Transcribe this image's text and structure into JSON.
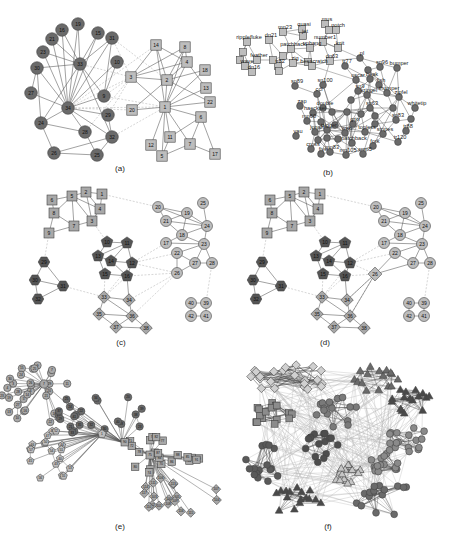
{
  "figure": {
    "colors": {
      "dark_node": "#6a6a6a",
      "darker_node": "#555555",
      "light_node": "#bdbdbd",
      "mid_node": "#a8a8a8",
      "edge": "#555555",
      "dashed_edge": "#bbbbbb",
      "node_stroke": "#444444"
    },
    "panels": [
      {
        "id": "a",
        "caption": "(a)"
      },
      {
        "id": "b",
        "caption": "(b)"
      },
      {
        "id": "c",
        "caption": "(c)"
      },
      {
        "id": "d",
        "caption": "(d)"
      },
      {
        "id": "e",
        "caption": "(e)"
      },
      {
        "id": "f",
        "caption": "(f)"
      }
    ]
  },
  "panel_a": {
    "caption": "(a)",
    "circles": [
      {
        "id": "19",
        "x": 78,
        "y": 24
      },
      {
        "id": "16",
        "x": 62,
        "y": 30
      },
      {
        "id": "15",
        "x": 98,
        "y": 33
      },
      {
        "id": "21",
        "x": 52,
        "y": 39
      },
      {
        "id": "31",
        "x": 112,
        "y": 38
      },
      {
        "id": "23",
        "x": 43,
        "y": 52
      },
      {
        "id": "33",
        "x": 80,
        "y": 64
      },
      {
        "id": "10",
        "x": 117,
        "y": 62
      },
      {
        "id": "30",
        "x": 37,
        "y": 68
      },
      {
        "id": "27",
        "x": 31,
        "y": 93
      },
      {
        "id": "9",
        "x": 104,
        "y": 96
      },
      {
        "id": "34",
        "x": 68,
        "y": 108
      },
      {
        "id": "29",
        "x": 108,
        "y": 115
      },
      {
        "id": "24",
        "x": 41,
        "y": 123
      },
      {
        "id": "28",
        "x": 85,
        "y": 132
      },
      {
        "id": "32",
        "x": 112,
        "y": 137
      },
      {
        "id": "26",
        "x": 54,
        "y": 153
      },
      {
        "id": "25",
        "x": 97,
        "y": 155
      }
    ],
    "squares": [
      {
        "id": "14",
        "x": 156,
        "y": 45
      },
      {
        "id": "8",
        "x": 185,
        "y": 47
      },
      {
        "id": "4",
        "x": 187,
        "y": 62
      },
      {
        "id": "18",
        "x": 205,
        "y": 70
      },
      {
        "id": "3",
        "x": 131,
        "y": 77
      },
      {
        "id": "2",
        "x": 167,
        "y": 80
      },
      {
        "id": "13",
        "x": 206,
        "y": 88
      },
      {
        "id": "22",
        "x": 210,
        "y": 102
      },
      {
        "id": "20",
        "x": 132,
        "y": 110
      },
      {
        "id": "1",
        "x": 165,
        "y": 107
      },
      {
        "id": "6",
        "x": 201,
        "y": 117
      },
      {
        "id": "11",
        "x": 170,
        "y": 137
      },
      {
        "id": "7",
        "x": 190,
        "y": 144
      },
      {
        "id": "12",
        "x": 151,
        "y": 145
      },
      {
        "id": "5",
        "x": 162,
        "y": 156
      },
      {
        "id": "17",
        "x": 215,
        "y": 154
      }
    ]
  },
  "panel_b": {
    "caption": "(b)",
    "square_labels": [
      "mn23",
      "quasi",
      "mus",
      "notch",
      "ripplefluke",
      "dn21",
      "jet",
      "number1",
      "knit",
      "patchback",
      "upbang",
      "feather",
      "wave",
      "dn16",
      "tr82",
      "cross",
      "beescratch",
      "dn63",
      "zig",
      "sn4",
      "sn96",
      "gallatin"
    ],
    "circle_labels": [
      "sn89",
      "pl",
      "tr77",
      "bumper",
      "oscar",
      "beak",
      "sn9",
      "sn100",
      "fish",
      "thumper",
      "zipfel",
      "sn63",
      "whitetip",
      "zap",
      "double",
      "haecksel",
      "mn60",
      "sn83",
      "grin",
      "shmuddel",
      "vau",
      "scabs",
      "stripes",
      "tr88",
      "cross",
      "patchback",
      "tr120",
      "five",
      "mn83",
      "mn105",
      "smn5",
      "jonah",
      "fork",
      "topless",
      "trigger",
      "web",
      "kringel",
      "ccl",
      "sn90",
      "number1"
    ],
    "label_list_visible": [
      "mn23",
      "quasi",
      "mus",
      "notch",
      "ripplefluke",
      "dn21",
      "jet",
      "number1",
      "knit",
      "patchback",
      "upbang",
      "feather",
      "wave",
      "dn16",
      "tr82",
      "beescratch",
      "dn63",
      "sn89",
      "pl",
      "tr77",
      "bumper",
      "oscar",
      "beak",
      "sn96",
      "sn9",
      "sn100",
      "fish",
      "thumper",
      "zipfel",
      "sn63",
      "whitetip",
      "zap",
      "double",
      "haecksel",
      "mn60",
      "sn83",
      "grin",
      "vau",
      "stripes",
      "tr88",
      "cross",
      "patchback",
      "tr120",
      "five",
      "mn83",
      "mn105",
      "smn5",
      "fork"
    ]
  },
  "panel_c": {
    "caption": "(c)",
    "squares": [
      {
        "id": "6",
        "x": 52,
        "y": 20
      },
      {
        "id": "5",
        "x": 72,
        "y": 16
      },
      {
        "id": "2",
        "x": 86,
        "y": 12
      },
      {
        "id": "1",
        "x": 102,
        "y": 14
      },
      {
        "id": "8",
        "x": 54,
        "y": 33
      },
      {
        "id": "4",
        "x": 100,
        "y": 29
      },
      {
        "id": "7",
        "x": 74,
        "y": 46
      },
      {
        "id": "3",
        "x": 92,
        "y": 41
      },
      {
        "id": "9",
        "x": 49,
        "y": 53
      }
    ],
    "pentagons": [
      {
        "id": "10",
        "x": 107,
        "y": 62
      },
      {
        "id": "11",
        "x": 127,
        "y": 63
      },
      {
        "id": "13",
        "x": 98,
        "y": 76
      },
      {
        "id": "14",
        "x": 111,
        "y": 81
      },
      {
        "id": "12",
        "x": 132,
        "y": 83
      },
      {
        "id": "15",
        "x": 105,
        "y": 94
      },
      {
        "id": "16",
        "x": 127,
        "y": 96
      }
    ],
    "hexagons": [
      {
        "id": "29",
        "x": 44,
        "y": 82
      },
      {
        "id": "30",
        "x": 35,
        "y": 100
      },
      {
        "id": "31",
        "x": 63,
        "y": 106
      },
      {
        "id": "32",
        "x": 38,
        "y": 119
      }
    ],
    "diamonds": [
      {
        "id": "33",
        "x": 104,
        "y": 117
      },
      {
        "id": "34",
        "x": 129,
        "y": 120
      },
      {
        "id": "35",
        "x": 99,
        "y": 134
      },
      {
        "id": "36",
        "x": 132,
        "y": 136
      },
      {
        "id": "37",
        "x": 116,
        "y": 147
      },
      {
        "id": "38",
        "x": 146,
        "y": 148
      }
    ],
    "circles": [
      {
        "id": "20",
        "x": 158,
        "y": 27
      },
      {
        "id": "25",
        "x": 203,
        "y": 23
      },
      {
        "id": "19",
        "x": 187,
        "y": 33
      },
      {
        "id": "21",
        "x": 166,
        "y": 41
      },
      {
        "id": "24",
        "x": 207,
        "y": 46
      },
      {
        "id": "18",
        "x": 182,
        "y": 55
      },
      {
        "id": "17",
        "x": 166,
        "y": 63
      },
      {
        "id": "23",
        "x": 204,
        "y": 64
      },
      {
        "id": "22",
        "x": 177,
        "y": 73
      },
      {
        "id": "27",
        "x": 195,
        "y": 83
      },
      {
        "id": "28",
        "x": 212,
        "y": 83
      },
      {
        "id": "26",
        "x": 177,
        "y": 93
      },
      {
        "id": "40",
        "x": 191,
        "y": 123
      },
      {
        "id": "39",
        "x": 206,
        "y": 123
      },
      {
        "id": "42",
        "x": 191,
        "y": 136
      },
      {
        "id": "41",
        "x": 206,
        "y": 136
      }
    ]
  },
  "panel_d": {
    "caption": "(d)"
  },
  "panel_e": {
    "caption": "(e)"
  },
  "panel_f": {
    "caption": "(f)"
  }
}
